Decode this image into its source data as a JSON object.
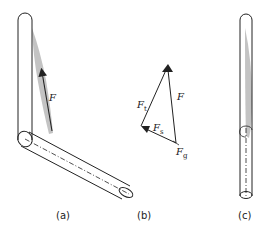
{
  "figure": {
    "panels": [
      {
        "id": "a",
        "caption": "(a)",
        "force_label": "F",
        "description": "Bent tube: vertical segment joined to an angled segment; gray shaded region along vertical segment with upward force arrow F"
      },
      {
        "id": "b",
        "caption": "(b)",
        "vector_labels": {
          "F": "F",
          "F_t": {
            "base": "F",
            "sub": "t"
          },
          "F_s": {
            "base": "F",
            "sub": "s"
          },
          "F_g": {
            "base": "F",
            "sub": "g"
          }
        },
        "description": "Force triangle decomposing F into F_t, F_s and F_g"
      },
      {
        "id": "c",
        "caption": "(c)",
        "description": "Straight vertical tube with gray shaded elongated region and dash-dot centerline in lower part"
      }
    ],
    "colors": {
      "stroke": "#222222",
      "shade": "#b8b8b8",
      "background": "#ffffff"
    }
  }
}
